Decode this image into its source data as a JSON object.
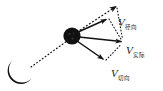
{
  "figure": {
    "name": "velocity-decomposition-diagram",
    "background_color": "#ffffff",
    "ink_color": "#111111",
    "width": 163,
    "height": 91
  },
  "objects": {
    "crescent": {
      "name": "crescent-moon-shape",
      "center_x": 21,
      "center_y": 72,
      "radius": 13
    },
    "ball": {
      "name": "ball-particle",
      "center_x": 72,
      "center_y": 36,
      "radius": 8.5
    },
    "sight_line": {
      "name": "dotted-sight-line",
      "from_x": 32,
      "from_y": 66,
      "to_x": 66,
      "to_y": 41,
      "style": "dotted"
    }
  },
  "vectors": [
    {
      "id": "resultant",
      "label_symbol": "V",
      "label_subscript": "径向",
      "style": "dotted",
      "from_x": 72,
      "from_y": 36,
      "to_x": 118,
      "to_y": 5,
      "label_x": 118,
      "label_y": 13
    },
    {
      "id": "tangential",
      "label_symbol": "V",
      "label_subscript": "",
      "style": "solid",
      "from_x": 72,
      "from_y": 36,
      "to_x": 108,
      "to_y": 18,
      "label_x": 0,
      "label_y": 0
    },
    {
      "id": "actual",
      "label_symbol": "V",
      "label_subscript": "实际",
      "style": "solid",
      "from_x": 72,
      "from_y": 36,
      "to_x": 124,
      "to_y": 42,
      "label_x": 126,
      "label_y": 41
    },
    {
      "id": "component",
      "label_symbol": "V",
      "label_subscript": "切向",
      "style": "solid",
      "from_x": 72,
      "from_y": 36,
      "to_x": 105,
      "to_y": 61,
      "label_x": 111,
      "label_y": 64
    }
  ],
  "construction_lines": [
    {
      "name": "dotted-arc-upper",
      "from_x": 108,
      "from_y": 18,
      "to_x": 124,
      "to_y": 42,
      "style": "dotted"
    },
    {
      "name": "dotted-arc-lower",
      "from_x": 105,
      "from_y": 61,
      "to_x": 124,
      "to_y": 42,
      "style": "dotted"
    },
    {
      "name": "dotted-arc-outer",
      "from_x": 118,
      "from_y": 5,
      "to_x": 124,
      "to_y": 42,
      "style": "dotted"
    }
  ],
  "labels": {
    "resultant": {
      "symbol": "V",
      "subscript": "径向"
    },
    "actual": {
      "symbol": "V",
      "subscript": "实际"
    },
    "component": {
      "symbol": "V",
      "subscript": "切向"
    }
  }
}
